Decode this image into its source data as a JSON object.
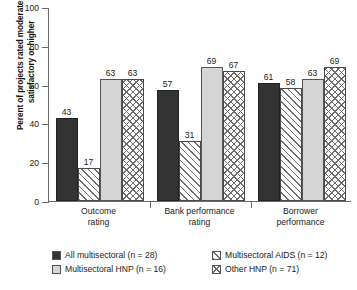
{
  "chart_data": {
    "type": "bar",
    "title": "",
    "xlabel": "",
    "ylabel": "Perent of projects rated moderately satisfactory or higher",
    "ylim": [
      0,
      100
    ],
    "yticks": [
      0,
      20,
      40,
      60,
      80,
      100
    ],
    "grid": false,
    "legend_position": "bottom",
    "categories": [
      "Outcome rating",
      "Bank performance rating",
      "Borrower performance"
    ],
    "category_lines": [
      [
        "Outcome",
        "rating"
      ],
      [
        "Bank performance",
        "rating"
      ],
      [
        "Borrower",
        "performance"
      ]
    ],
    "series": [
      {
        "name": "All multisectoral (n = 28)",
        "pattern": "solid-dark",
        "color": "#333333",
        "values": [
          43,
          57,
          61
        ]
      },
      {
        "name": "Multisectoral AIDS (n = 12)",
        "pattern": "diagonal-hatch",
        "color": "#ffffff",
        "values": [
          17,
          31,
          58
        ]
      },
      {
        "name": "Multisectoral HNP (n = 16)",
        "pattern": "light-gray",
        "color": "#d5d5d5",
        "values": [
          63,
          69,
          63
        ]
      },
      {
        "name": "Other HNP (n = 71)",
        "pattern": "cross-hatch",
        "color": "#ffffff",
        "values": [
          63,
          67,
          69
        ]
      }
    ]
  },
  "legend": {
    "items": [
      {
        "label": "All multisectoral (n = 28)",
        "pattern": "solid-dark"
      },
      {
        "label": "Multisectoral AIDS (n = 12)",
        "pattern": "diagonal-hatch"
      },
      {
        "label": "Multisectoral HNP (n = 16)",
        "pattern": "light-gray"
      },
      {
        "label": "Other HNP (n = 71)",
        "pattern": "cross-hatch"
      }
    ]
  },
  "axis": {
    "y_title": "Perent of projects rated moderately satisfactory or higher",
    "y_tick_labels": [
      "100",
      "80",
      "60",
      "40",
      "20",
      "0"
    ]
  }
}
